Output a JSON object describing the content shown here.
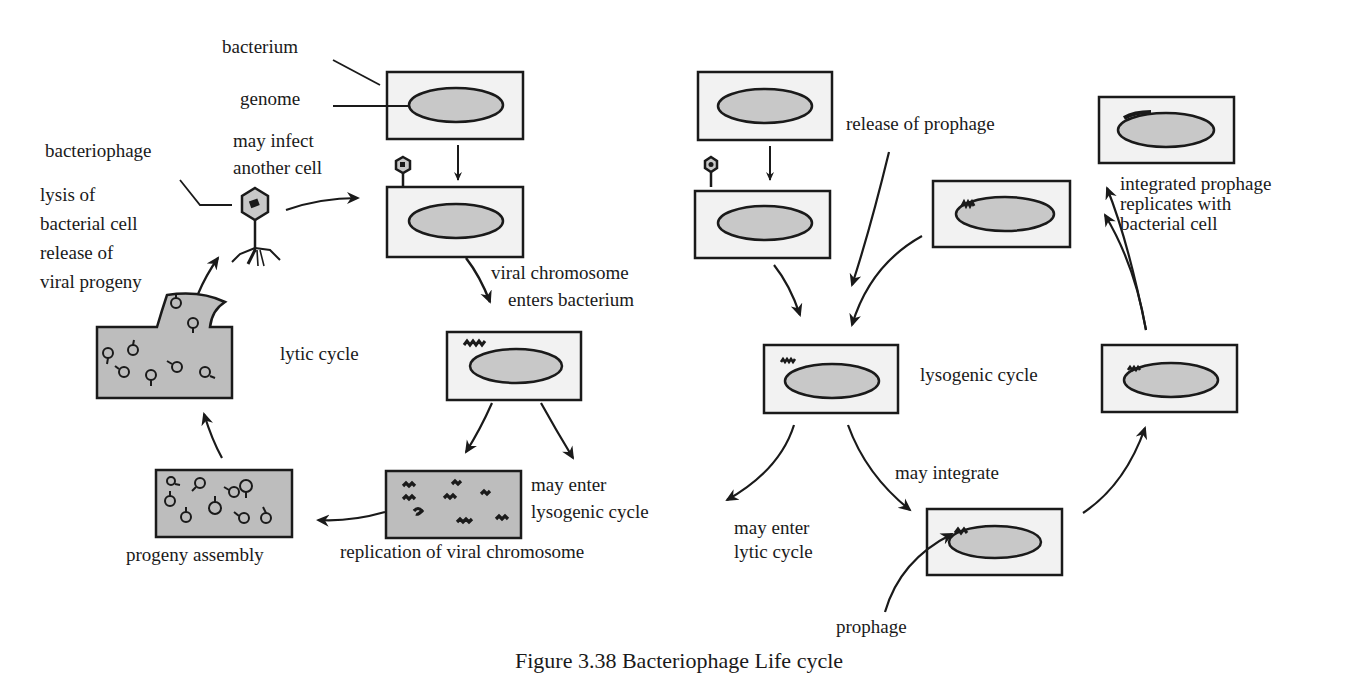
{
  "figure": {
    "caption": "Figure 3.38 Bacteriophage Life cycle",
    "colors": {
      "cell_fill": "#f2f2f2",
      "genome_fill": "#c8c8c8",
      "lysed_fill": "#bdbdbd",
      "stroke": "#1a1a1a"
    }
  },
  "lytic": {
    "labels": {
      "bacterium": "bacterium",
      "genome": "genome",
      "bacteriophage": "bacteriophage",
      "may_infect_1": "may infect",
      "may_infect_2": "another cell",
      "lysis_1": "lysis of",
      "lysis_2": "bacterial cell",
      "lysis_3": "release of",
      "lysis_4": "viral progeny",
      "viral_chrom_1": "viral chromosome",
      "viral_chrom_2": "enters bacterium",
      "cycle_name": "lytic cycle",
      "may_enter_lyso_1": "may enter",
      "may_enter_lyso_2": "lysogenic cycle",
      "replication": "replication of viral chromosome",
      "progeny_assembly": "progeny assembly"
    }
  },
  "lysogenic": {
    "labels": {
      "release_prophage": "release of prophage",
      "integrated_1": "integrated prophage",
      "integrated_2": "replicates with",
      "integrated_3": "bacterial cell",
      "cycle_name": "lysogenic cycle",
      "may_integrate": "may integrate",
      "may_enter_lytic_1": "may enter",
      "may_enter_lytic_2": "lytic cycle",
      "prophage": "prophage"
    }
  }
}
